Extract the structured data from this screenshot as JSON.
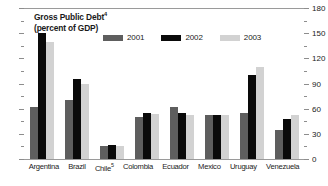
{
  "chart_data": {
    "type": "bar",
    "title": "Gross Public Debt",
    "title_footnote": "4",
    "subtitle": "(percent of GDP)",
    "xlabel": "",
    "ylabel": "",
    "ylim": [
      0,
      180
    ],
    "yticks": [
      0,
      30,
      60,
      90,
      120,
      150,
      180
    ],
    "ytick_labels": [
      "0",
      "30",
      "60",
      "90",
      "120",
      "150",
      "180"
    ],
    "minor_tick_step": 15,
    "axis_position": "right",
    "grid": false,
    "legend_position": "top-center",
    "categories": [
      "Argentina",
      "Brazil",
      "Chile",
      "Colombia",
      "Ecuador",
      "Mexico",
      "Uruguay",
      "Venezuela"
    ],
    "category_footnotes": [
      "",
      "",
      "5",
      "",
      "",
      "",
      "",
      ""
    ],
    "series": [
      {
        "name": "2001",
        "color": "#5e5e5e",
        "values": [
          62,
          70,
          15,
          50,
          62,
          52,
          55,
          35
        ]
      },
      {
        "name": "2002",
        "color": "#0a0a0a",
        "values": [
          150,
          95,
          17,
          55,
          55,
          53,
          100,
          48
        ]
      },
      {
        "name": "2003",
        "color": "#d2d2d2",
        "values": [
          140,
          90,
          16,
          54,
          52,
          53,
          110,
          52
        ]
      }
    ]
  },
  "legend": {
    "items": [
      {
        "label": "2001",
        "color": "#5e5e5e"
      },
      {
        "label": "2002",
        "color": "#0a0a0a"
      },
      {
        "label": "2003",
        "color": "#d2d2d2"
      }
    ]
  }
}
